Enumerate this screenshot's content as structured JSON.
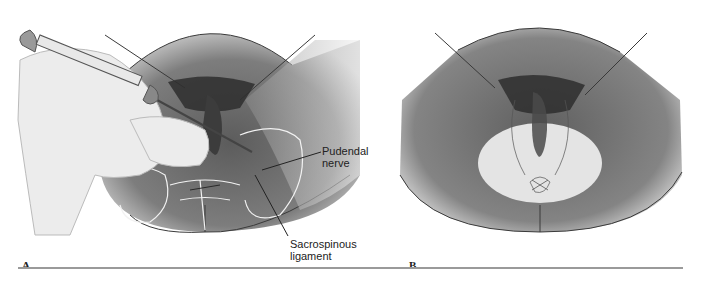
{
  "figure": {
    "panels": [
      {
        "id": "A",
        "label": "A",
        "description": "Gloved hand inserting syringe needle transvaginally toward the pudendal nerve near the sacrospinous ligament (pudendal nerve block)",
        "callouts": [
          {
            "text_line1": "Pudendal",
            "text_line2": "nerve"
          },
          {
            "text_line1": "Sacrospinous",
            "text_line2": "ligament"
          }
        ]
      },
      {
        "id": "B",
        "label": "B",
        "description": "Perineum with shaded oval showing area of anesthesia after pudendal block"
      }
    ],
    "colors": {
      "skin_dark": "#6e6e6e",
      "skin_light": "#d9d9d9",
      "anesthetized_area": "#e4e4e4",
      "glove": "#ececec",
      "outline": "#3a3a3a",
      "bone_outline": "#f2f2f2",
      "rule": "#9a9a9a"
    }
  }
}
